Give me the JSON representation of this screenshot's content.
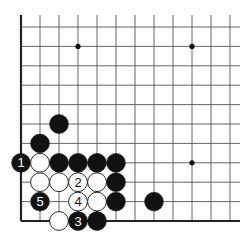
{
  "board": {
    "type": "go-diagram",
    "corner": "bottom-left",
    "columns": 12,
    "rows": 11,
    "origin_x": 21,
    "origin_y": 27,
    "spacing_x": 19.0,
    "spacing_y": 19.4,
    "edge_left": true,
    "edge_bottom": true,
    "colors": {
      "line": "#555555",
      "edge": "#222222",
      "black": "#111111",
      "white": "#ffffff",
      "star": "#111111"
    },
    "star_points": [
      {
        "col": 3,
        "row": 1
      },
      {
        "col": 9,
        "row": 1
      },
      {
        "col": 9,
        "row": 7
      }
    ],
    "stones": [
      {
        "col": 2,
        "row": 5,
        "color": "black",
        "label": ""
      },
      {
        "col": 1,
        "row": 6,
        "color": "black",
        "label": ""
      },
      {
        "col": 0,
        "row": 7,
        "color": "black",
        "label": "1"
      },
      {
        "col": 1,
        "row": 7,
        "color": "white",
        "label": ""
      },
      {
        "col": 2,
        "row": 7,
        "color": "black",
        "label": ""
      },
      {
        "col": 3,
        "row": 7,
        "color": "black",
        "label": ""
      },
      {
        "col": 4,
        "row": 7,
        "color": "black",
        "label": ""
      },
      {
        "col": 5,
        "row": 7,
        "color": "black",
        "label": ""
      },
      {
        "col": 1,
        "row": 8,
        "color": "white",
        "label": ""
      },
      {
        "col": 2,
        "row": 8,
        "color": "white",
        "label": ""
      },
      {
        "col": 3,
        "row": 8,
        "color": "white",
        "label": "2"
      },
      {
        "col": 4,
        "row": 8,
        "color": "white",
        "label": ""
      },
      {
        "col": 5,
        "row": 8,
        "color": "black",
        "label": ""
      },
      {
        "col": 1,
        "row": 9,
        "color": "black",
        "label": "5"
      },
      {
        "col": 3,
        "row": 9,
        "color": "white",
        "label": "4"
      },
      {
        "col": 4,
        "row": 9,
        "color": "white",
        "label": ""
      },
      {
        "col": 5,
        "row": 9,
        "color": "black",
        "label": ""
      },
      {
        "col": 7,
        "row": 9,
        "color": "black",
        "label": ""
      },
      {
        "col": 2,
        "row": 10,
        "color": "white",
        "label": ""
      },
      {
        "col": 3,
        "row": 10,
        "color": "black",
        "label": "3"
      },
      {
        "col": 4,
        "row": 10,
        "color": "black",
        "label": ""
      }
    ]
  }
}
